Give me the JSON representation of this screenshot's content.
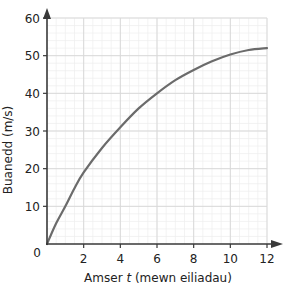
{
  "chart_data": {
    "type": "line",
    "title": "",
    "xlabel": "Amser t (mewn eiliadau)",
    "xlabel_parts": {
      "pre": "Amser ",
      "var": "t",
      "post": " (mewn eiliadau)"
    },
    "ylabel": "Buanedd (m/s)",
    "xlim": [
      0,
      12
    ],
    "ylim": [
      0,
      60
    ],
    "x_ticks": [
      2,
      4,
      6,
      8,
      10,
      12
    ],
    "y_ticks": [
      10,
      20,
      30,
      40,
      50,
      60
    ],
    "origin_label": "0",
    "grid": true,
    "minor_grid": true,
    "series": [
      {
        "name": "Buanedd",
        "x": [
          0,
          0.5,
          1,
          1.5,
          2,
          3,
          4,
          5,
          6,
          7,
          8,
          9,
          10,
          11,
          12
        ],
        "values": [
          0,
          5.5,
          10,
          14.8,
          19,
          25.5,
          31,
          36,
          40,
          43.5,
          46.2,
          48.5,
          50.3,
          51.5,
          52
        ],
        "color": "#6b6b6b"
      }
    ]
  },
  "colors": {
    "axis": "#3a3a3a",
    "major_grid": "#d9d9d9",
    "minor_grid": "#eeeeee",
    "curve": "#6b6b6b"
  }
}
